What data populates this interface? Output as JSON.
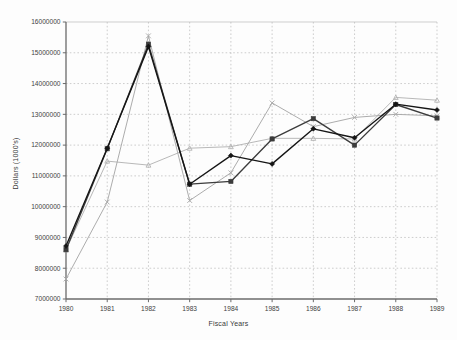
{
  "chart_data": {
    "type": "line",
    "title": "",
    "xlabel": "Fiscal Years",
    "ylabel": "Dollars (1000's)",
    "categories": [
      "1980",
      "1981",
      "1982",
      "1983",
      "1984",
      "1985",
      "1986",
      "1987",
      "1988",
      "1989"
    ],
    "x": [
      1980,
      1981,
      1982,
      1983,
      1984,
      1985,
      1986,
      1987,
      1988,
      1989
    ],
    "xlim": [
      1980,
      1989
    ],
    "ylim": [
      7000000,
      16000000
    ],
    "ytick_labels": [
      "7000000",
      "8000000",
      "9000000",
      "10000000",
      "11000000",
      "12000000",
      "13000000",
      "14000000",
      "15000000",
      "16000000"
    ],
    "ytick_values": [
      7000000,
      8000000,
      9000000,
      10000000,
      11000000,
      12000000,
      13000000,
      14000000,
      15000000,
      16000000
    ],
    "grid": true,
    "grid_style": "dotted",
    "legend_position": "bottom-right",
    "series": [
      {
        "name": "Agencies",
        "marker": "filled-diamond",
        "color": "#151515",
        "values": [
          8720000,
          11900000,
          15200000,
          10730000,
          11660000,
          11390000,
          12530000,
          12240000,
          13330000,
          13140000
        ]
      },
      {
        "name": "dept",
        "marker": "filled-square",
        "color": "#3c3c3c",
        "values": [
          8600000,
          11880000,
          15280000,
          10730000,
          10820000,
          12200000,
          12860000,
          12000000,
          13320000,
          12880000
        ]
      },
      {
        "name": "OMB",
        "marker": "triangle",
        "color": "#b4b4b4",
        "values": [
          8600000,
          11480000,
          11350000,
          11900000,
          11950000,
          12220000,
          12220000,
          12200000,
          13550000,
          13460000
        ]
      },
      {
        "name": "Congress",
        "marker": "cross-x",
        "color": "#a8a8a8",
        "values": [
          7650000,
          10150000,
          15550000,
          10200000,
          11100000,
          13370000,
          12600000,
          12900000,
          13000000,
          12950000
        ]
      }
    ]
  },
  "legend": {
    "entries": [
      {
        "label": "Agencies"
      },
      {
        "label": "dept"
      },
      {
        "label": "OMB"
      },
      {
        "label": "Congress"
      }
    ]
  },
  "colors": {
    "axis": "#6b6b6b",
    "grid": "#b9b9b9",
    "text": "#3a3a3a",
    "background": "#fdfdfd"
  }
}
